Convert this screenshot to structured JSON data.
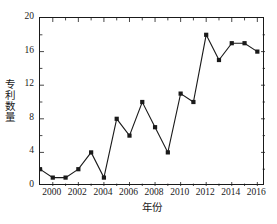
{
  "chart_data": {
    "type": "line",
    "title": "",
    "xlabel": "年份",
    "ylabel": "专利数量",
    "x": [
      1999,
      2000,
      2001,
      2002,
      2003,
      2004,
      2005,
      2006,
      2007,
      2008,
      2009,
      2010,
      2011,
      2012,
      2013,
      2014,
      2015,
      2016
    ],
    "values": [
      2,
      1,
      1,
      2,
      4,
      1,
      8,
      6,
      10,
      7,
      4,
      11,
      10,
      18,
      15,
      17,
      17,
      16
    ],
    "series": [
      {
        "name": "专利数量",
        "values": [
          2,
          1,
          1,
          2,
          4,
          1,
          8,
          6,
          10,
          7,
          4,
          11,
          10,
          18,
          15,
          17,
          17,
          16
        ]
      }
    ],
    "xlim": [
      1999,
      2016.6
    ],
    "ylim": [
      0,
      20
    ],
    "xticks": [
      2000,
      2002,
      2004,
      2006,
      2008,
      2010,
      2012,
      2014,
      2016
    ],
    "xtick_labels": [
      "2000",
      "2002",
      "2004",
      "2006",
      "2008",
      "2010",
      "2012",
      "2014",
      "2016"
    ],
    "yticks": [
      0,
      4,
      8,
      12,
      16,
      20
    ],
    "ytick_labels": [
      "0",
      "4",
      "8",
      "12",
      "16",
      "20"
    ],
    "grid": false,
    "legend": null,
    "marker": "square",
    "marker_color": "#1a1a1a",
    "line_color": "#1a1a1a"
  }
}
